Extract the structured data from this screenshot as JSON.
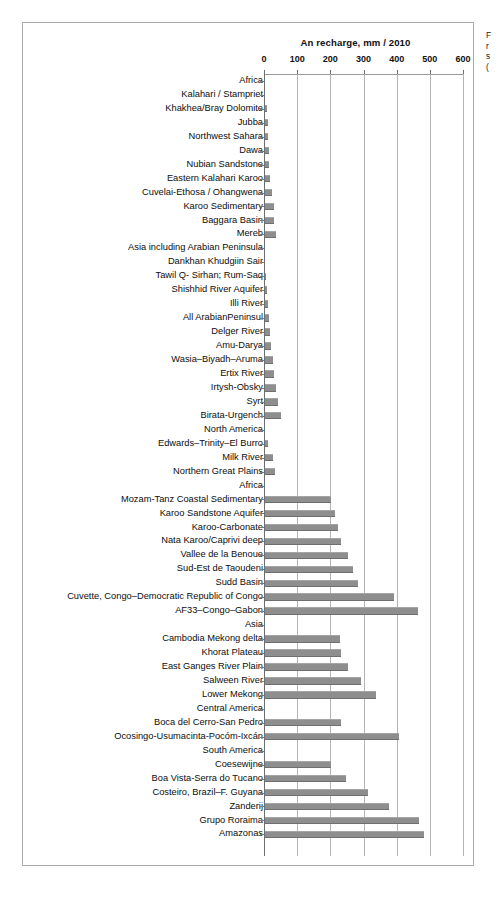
{
  "chart_data": {
    "type": "bar",
    "orientation": "horizontal",
    "title": "An  recharge, mm / 2010",
    "xlabel": "",
    "ylabel": "",
    "xlim": [
      0,
      600
    ],
    "xticks": [
      0,
      100,
      200,
      300,
      400,
      500,
      600
    ],
    "xtick_labels": [
      "0",
      "100",
      "200",
      "300",
      "400",
      "500",
      "600"
    ],
    "grid": true,
    "axis_position": "top",
    "legend": false,
    "bar_color": "#8e8e8e",
    "categories": [
      "Africa",
      "Kalahari / Stampriet",
      "Khakhea/Bray Dolomite",
      "Jubba",
      "Northwest Sahara",
      "Dawa",
      "Nubian Sandstone",
      "Eastern Kalahari Karoo",
      "Cuvelai-Ethosa / Ohangwena",
      "Karoo Sedimentary",
      "Baggara Basin",
      "Mereb",
      "Asia including Arabian Peninsula",
      "Dankhan Khudgiin Sair",
      "Tawil Q- Sirhan; Rum-Saq",
      "Shishhid River Aquifer",
      "Illi River",
      "All ArabianPeninsul",
      "Delger River",
      "Amu-Darya",
      "Wasia–Biyadh–Aruma",
      "Ertix River",
      "Irtysh-Obsky",
      "Syrt",
      "Birata-Urgench",
      "North America",
      "Edwards–Trinity–El Burro",
      "Milk River",
      "Northern Great Plains",
      "Africa",
      "Mozam-Tanz Coastal Sedimentary",
      "Karoo Sandstone Aquifer",
      "Karoo-Carbonate",
      "Nata Karoo/Caprivi deep",
      "Vallee de la Benoue",
      "Sud-Est de Taoudeni",
      "Sudd Basin",
      "Cuvette, Congo–Democratic Republic of Congo",
      "AF33–Congo–Gabon",
      "Asia",
      "Cambodia Mekong delta",
      "Khorat Plateau",
      "East Ganges River Plain",
      "Salween River",
      "Lower Mekong",
      "Central America",
      "Boca del Cerro-San Pedro",
      "Ocosingo-Usumacinta-Pocóm-Ixcán",
      "South America",
      "Coesewijne",
      "Boa Vista-Serra do Tucano",
      "Costeiro, Brazil–F. Guyana",
      "Zanderij",
      "Grupo Roraima",
      "Amazonas"
    ],
    "values": [
      0,
      0,
      6,
      9,
      9,
      11,
      12,
      15,
      21,
      26,
      27,
      33,
      0,
      0,
      3,
      6,
      9,
      12,
      15,
      18,
      24,
      27,
      33,
      40,
      48,
      0,
      9,
      24,
      30,
      0,
      200,
      210,
      220,
      230,
      250,
      265,
      280,
      390,
      460,
      0,
      225,
      230,
      250,
      290,
      335,
      0,
      230,
      405,
      0,
      200,
      245,
      310,
      375,
      465,
      480
    ],
    "group_headers": [
      "Africa",
      "Asia including Arabian Peninsula",
      "North America",
      "Africa",
      "Asia",
      "Central America",
      "South America"
    ]
  },
  "side_caption": {
    "line1": "F",
    "line2": "r",
    "line3": "s",
    "line4": "("
  }
}
